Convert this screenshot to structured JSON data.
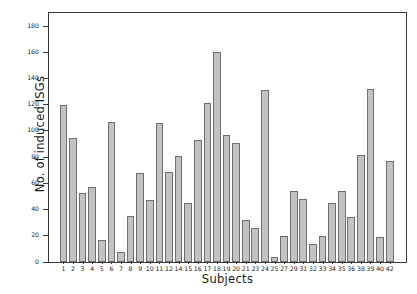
{
  "chart_data": {
    "type": "bar",
    "title": "",
    "xlabel": "Subjects",
    "ylabel": "No. of induced ISGs",
    "ylim": [
      0,
      190
    ],
    "ytick_labels": [
      "0",
      "20",
      "40",
      "60",
      "80",
      "100",
      "120",
      "140",
      "160",
      "180"
    ],
    "ytick_values": [
      0,
      20,
      40,
      60,
      80,
      100,
      120,
      140,
      160,
      180
    ],
    "grid": false,
    "legend": "none",
    "bar_color": "#c2c2c2",
    "bar_edge_color": "#6f6f6f",
    "axis_color": "#3a3a3a",
    "categories": [
      "1",
      "2",
      "3",
      "4",
      "5",
      "6",
      "7",
      "8",
      "9",
      "10",
      "11",
      "12",
      "14",
      "15",
      "16",
      "17",
      "18",
      "19",
      "20",
      "21",
      "23",
      "24",
      "25",
      "27",
      "29",
      "31",
      "32",
      "33",
      "34",
      "35",
      "36",
      "38",
      "39",
      "40",
      "42"
    ],
    "values": [
      120,
      95,
      53,
      57,
      17,
      107,
      8,
      35,
      68,
      47,
      106,
      69,
      81,
      45,
      93,
      121,
      160,
      97,
      91,
      32,
      26,
      131,
      4,
      20,
      54,
      48,
      14,
      20,
      45,
      54,
      34,
      82,
      132,
      19,
      77
    ]
  }
}
